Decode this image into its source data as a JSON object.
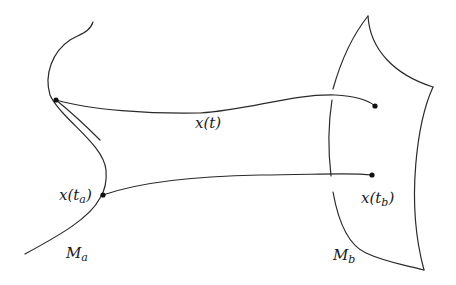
{
  "figure": {
    "labels": {
      "path": "x(t)",
      "start_point": "x(t",
      "start_sub": "a",
      "end_point": "x(t",
      "end_sub": "b",
      "manifold_a": "M",
      "manifold_a_sub": "a",
      "manifold_b": "M",
      "manifold_b_sub": "b",
      "close_paren": ")"
    },
    "colors": {
      "stroke": "#2a2a2a",
      "background": "#ffffff"
    }
  }
}
